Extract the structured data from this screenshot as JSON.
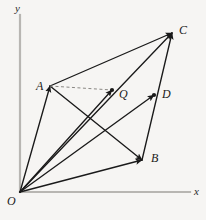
{
  "figure": {
    "width": 206,
    "height": 220,
    "background_color": "#f6f5f3",
    "stroke_color": "#1a1a1a",
    "axis_color": "#b8b6b2",
    "dashed_color": "#8a8884"
  },
  "axes": {
    "origin_label": "O",
    "x_label": "x",
    "y_label": "y",
    "origin_px": {
      "x": 20,
      "y": 192
    },
    "x_axis_end_px": {
      "x": 190,
      "y": 192
    },
    "y_axis_top_px": {
      "x": 20,
      "y": 15
    }
  },
  "points": [
    {
      "id": "O",
      "label": "O",
      "x": 20,
      "y": 192,
      "label_x": 7,
      "label_y": 195
    },
    {
      "id": "A",
      "label": "A",
      "x": 50,
      "y": 86,
      "label_x": 36,
      "label_y": 80
    },
    {
      "id": "Q",
      "label": "Q",
      "x": 112,
      "y": 90,
      "label_x": 119,
      "label_y": 88
    },
    {
      "id": "C",
      "label": "C",
      "x": 172,
      "y": 33,
      "label_x": 179,
      "label_y": 24
    },
    {
      "id": "D",
      "label": "D",
      "x": 154,
      "y": 95,
      "label_x": 162,
      "label_y": 88
    },
    {
      "id": "B",
      "label": "B",
      "x": 142,
      "y": 160,
      "label_x": 151,
      "label_y": 152
    }
  ],
  "vectors": [
    {
      "name": "vector-OA",
      "from": "O",
      "to": "A",
      "style": "solid",
      "arrow": true
    },
    {
      "name": "vector-OQ",
      "from": "O",
      "to": "Q",
      "style": "solid",
      "arrow": true
    },
    {
      "name": "vector-OD",
      "from": "O",
      "to": "D",
      "style": "solid",
      "arrow": true
    },
    {
      "name": "vector-OB",
      "from": "O",
      "to": "B",
      "style": "solid",
      "arrow": true
    },
    {
      "name": "vector-OC",
      "from": "O",
      "to": "C",
      "style": "solid",
      "arrow": true
    },
    {
      "name": "segment-AC",
      "from": "A",
      "to": "C",
      "style": "solid",
      "arrow": true
    },
    {
      "name": "segment-AB",
      "from": "A",
      "to": "B",
      "style": "solid",
      "arrow": true
    },
    {
      "name": "segment-BC",
      "from": "B",
      "to": "C",
      "style": "solid",
      "arrow": true
    },
    {
      "name": "segment-AQ-dashed",
      "from": "A",
      "to": "Q",
      "style": "dashed",
      "arrow": false
    }
  ]
}
